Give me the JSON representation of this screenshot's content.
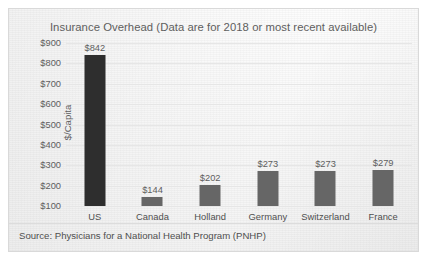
{
  "card": {
    "border_color": "#d9d9d9",
    "background_color": "#f7f7f7"
  },
  "source_note": "Source: Physicians for a National Health Program (PNHP)",
  "chart_data": {
    "type": "bar",
    "title": "Insurance Overhead (Data are for 2018 or most recent available)",
    "xlabel": "",
    "ylabel": "$/Capita",
    "ylim": [
      100,
      900
    ],
    "grid": true,
    "legend": "none",
    "axis_baseline": 100,
    "tick_step": 100,
    "yticks": [
      "$900",
      "$800",
      "$700",
      "$600",
      "$500",
      "$400",
      "$300",
      "$200",
      "$100"
    ],
    "categories": [
      "US",
      "Canada",
      "Holland",
      "Germany",
      "Switzerland",
      "France"
    ],
    "values": [
      842,
      144,
      202,
      273,
      273,
      279
    ],
    "data_labels": [
      "$842",
      "$144",
      "$202",
      "$273",
      "$273",
      "$279"
    ],
    "bar_colors": [
      "#2e2e2e",
      "#666666",
      "#666666",
      "#666666",
      "#666666",
      "#666666"
    ],
    "highlight_category": "US"
  }
}
